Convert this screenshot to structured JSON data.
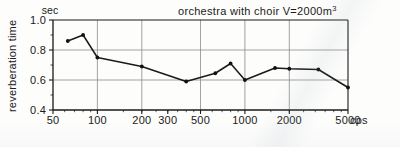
{
  "chart_data": {
    "type": "line",
    "title": "orchestra  with  choir  V=2000m",
    "title_superscript": "3",
    "xlabel": "",
    "ylabel": "reverberation time",
    "y_unit": "sec",
    "x_unit": "cps",
    "x_scale": "log",
    "xlim": [
      50,
      5000
    ],
    "ylim": [
      0.4,
      1.0
    ],
    "grid": true,
    "legend": "none",
    "x_tick_labels": [
      "50",
      "100",
      "200",
      "300",
      "500",
      "1000",
      "2000",
      "5000"
    ],
    "x_tick_values": [
      50,
      100,
      200,
      300,
      500,
      1000,
      2000,
      5000
    ],
    "x_gridline_values": [
      100,
      200,
      500,
      1000,
      2000,
      5000
    ],
    "y_tick_labels": [
      "1.0",
      "0.8",
      "0.6",
      "0.4"
    ],
    "y_tick_values": [
      1.0,
      0.8,
      0.6,
      0.4
    ],
    "y_gridline_values": [
      0.8,
      0.6
    ],
    "y_minor_tick_values": [
      0.9,
      0.7,
      0.5
    ],
    "series": [
      {
        "name": "reverberation time",
        "x": [
          63,
          80,
          100,
          200,
          400,
          630,
          800,
          1000,
          1600,
          2000,
          3150,
          5000
        ],
        "values": [
          0.86,
          0.9,
          0.75,
          0.69,
          0.59,
          0.645,
          0.71,
          0.6,
          0.68,
          0.675,
          0.67,
          0.55
        ]
      }
    ]
  },
  "colors": {
    "line": "#1a1a1a",
    "marker": "#111111",
    "grid": "#8c8c8c",
    "axis": "#1a1a1a",
    "background": "#fdfdfc"
  }
}
